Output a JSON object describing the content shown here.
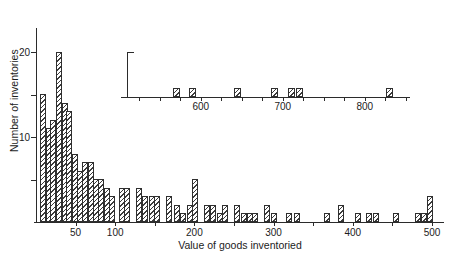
{
  "figure": {
    "background": "#ffffff",
    "ink_color": "#2b2b2b",
    "hatch_color": "#3c3c3c"
  },
  "chart_data": {
    "type": "bar",
    "title": "",
    "xlabel": "Value of goods inventoried",
    "ylabel": "Number of inventories",
    "legend": "none",
    "grid": "off",
    "hatch": "diagonal-forward-slash",
    "main": {
      "xlim": [
        0,
        510
      ],
      "ylim": [
        0,
        23
      ],
      "x_minor_tick_step": 50,
      "x_tick_values": [
        50,
        100,
        150,
        200,
        250,
        300,
        350,
        400,
        450,
        500
      ],
      "x_labeled_ticks": [
        50,
        100,
        200,
        300,
        400,
        500
      ],
      "y_tick_values": [
        5,
        10,
        15,
        20
      ],
      "y_labeled_ticks": [
        10,
        20
      ],
      "bin_width": 7,
      "bars": [
        {
          "value": 9,
          "count": 15
        },
        {
          "value": 16,
          "count": 11
        },
        {
          "value": 22,
          "count": 12
        },
        {
          "value": 29,
          "count": 20
        },
        {
          "value": 36,
          "count": 14
        },
        {
          "value": 42,
          "count": 13
        },
        {
          "value": 49,
          "count": 8
        },
        {
          "value": 56,
          "count": 6
        },
        {
          "value": 62,
          "count": 7
        },
        {
          "value": 69,
          "count": 7
        },
        {
          "value": 76,
          "count": 5
        },
        {
          "value": 82,
          "count": 5
        },
        {
          "value": 89,
          "count": 4
        },
        {
          "value": 96,
          "count": 3
        },
        {
          "value": 108,
          "count": 4
        },
        {
          "value": 115,
          "count": 4
        },
        {
          "value": 130,
          "count": 4
        },
        {
          "value": 138,
          "count": 3
        },
        {
          "value": 146,
          "count": 3
        },
        {
          "value": 153,
          "count": 3
        },
        {
          "value": 168,
          "count": 3
        },
        {
          "value": 178,
          "count": 2
        },
        {
          "value": 186,
          "count": 1
        },
        {
          "value": 194,
          "count": 2
        },
        {
          "value": 201,
          "count": 5
        },
        {
          "value": 216,
          "count": 2
        },
        {
          "value": 224,
          "count": 2
        },
        {
          "value": 232,
          "count": 1
        },
        {
          "value": 239,
          "count": 2
        },
        {
          "value": 254,
          "count": 2
        },
        {
          "value": 262,
          "count": 1
        },
        {
          "value": 270,
          "count": 1
        },
        {
          "value": 277,
          "count": 1
        },
        {
          "value": 292,
          "count": 2
        },
        {
          "value": 301,
          "count": 1
        },
        {
          "value": 319,
          "count": 1
        },
        {
          "value": 329,
          "count": 1
        },
        {
          "value": 367,
          "count": 1
        },
        {
          "value": 385,
          "count": 2
        },
        {
          "value": 406,
          "count": 1
        },
        {
          "value": 421,
          "count": 1
        },
        {
          "value": 429,
          "count": 1
        },
        {
          "value": 455,
          "count": 1
        },
        {
          "value": 482,
          "count": 1
        },
        {
          "value": 490,
          "count": 1
        },
        {
          "value": 497,
          "count": 3
        }
      ]
    },
    "inset": {
      "xlim": [
        510,
        855
      ],
      "x_minor_tick_step": 25,
      "x_labeled_ticks": [
        600,
        700,
        800
      ],
      "y_axis_max": 5,
      "bars": [
        {
          "value": 570,
          "count": 1
        },
        {
          "value": 590,
          "count": 1
        },
        {
          "value": 645,
          "count": 1
        },
        {
          "value": 690,
          "count": 1
        },
        {
          "value": 710,
          "count": 1
        },
        {
          "value": 720,
          "count": 1
        },
        {
          "value": 830,
          "count": 1
        }
      ]
    }
  }
}
